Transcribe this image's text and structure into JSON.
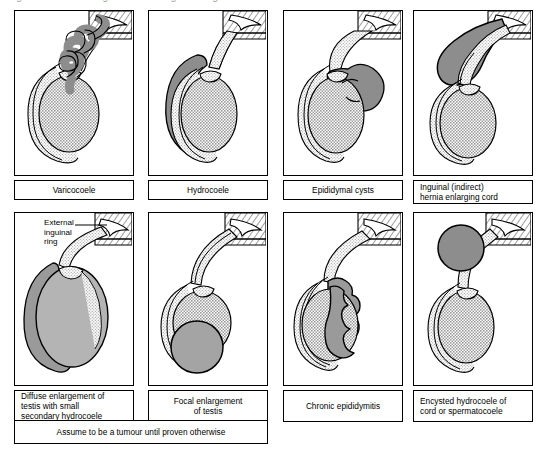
{
  "figure": {
    "top_title": "Fig. ...  Scrotal swellings and their diagnostic signs",
    "bottom_note": "Assume to be a tumour until proven otherwise"
  },
  "colors": {
    "outline": "#000000",
    "testis_fill": "#b4b4b4",
    "tunica_fill": "#e3e3e3",
    "lesion_fill": "#8d8d8d",
    "wall_hatch": "#000000",
    "paper": "#ffffff"
  },
  "annotations": {
    "external_inguinal_ring": "External\ninguinal\nring"
  },
  "panels": [
    {
      "id": "varicocoele",
      "caption": "Varicocoele",
      "caption_align": "center",
      "art": "tortuous dilated pampiniform plexus veins above testis"
    },
    {
      "id": "hydrocoele",
      "caption": "Hydrocoele",
      "caption_align": "center",
      "art": "fluid collection surrounding and enveloping the testis"
    },
    {
      "id": "epididymal-cysts",
      "caption": "Epididymal cysts",
      "caption_align": "center",
      "art": "lobulated cystic mass above and behind testis"
    },
    {
      "id": "inguinal-hernia",
      "caption": "Inguinal (indirect)\nhernia enlarging cord",
      "caption_align": "left",
      "art": "bowel descending through external inguinal ring into cord"
    },
    {
      "id": "diffuse-enlargement",
      "caption": "Diffuse enlargement of\ntestis with small\nsecondary hydrocoele",
      "caption_align": "left",
      "art": "uniformly enlarged testis with thin surrounding hydrocoele"
    },
    {
      "id": "focal-enlargement",
      "caption": "Focal enlargement\nof testis",
      "caption_align": "center",
      "art": "localised rounded swelling on lower pole of testis"
    },
    {
      "id": "chronic-epididymitis",
      "caption": "Chronic epididymitis",
      "caption_align": "center",
      "art": "thickened craggy epididymis along posterior border of testis"
    },
    {
      "id": "encysted-hydrocoele",
      "caption": "Encysted hydrocoele of\ncord or spermatocoele",
      "caption_align": "left",
      "art": "discrete spherical cyst high in the cord separate from testis"
    }
  ]
}
